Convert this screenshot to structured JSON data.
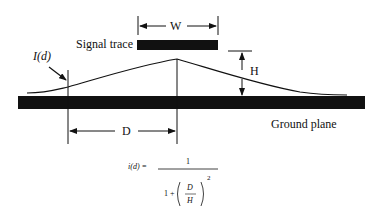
{
  "labels": {
    "signal_trace": "Signal trace",
    "width": "W",
    "height": "H",
    "current": "I(d)",
    "distance": "D",
    "ground_plane": "Ground plane"
  },
  "formula": {
    "lhs": "i(d) =",
    "numerator": "1",
    "denominator_prefix": "1 +",
    "frac_num": "D",
    "frac_den": "H",
    "exponent": "2"
  },
  "colors": {
    "ink": "#111111",
    "background": "#ffffff"
  }
}
